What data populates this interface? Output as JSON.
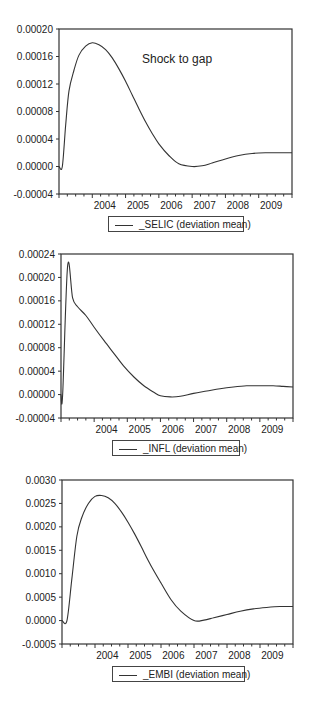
{
  "chart_data": [
    {
      "type": "line",
      "title": "",
      "annotation": "Shock to gap",
      "xlabel": "",
      "ylabel": "",
      "x_tick_labels": [
        "2004",
        "2005",
        "2006",
        "2007",
        "2008",
        "2009"
      ],
      "y_tick_labels": [
        "0.00020",
        "0.00016",
        "0.00012",
        "0.00008",
        "0.00004",
        "0.00000",
        "-0.00004"
      ],
      "ylim": [
        -4e-05,
        0.0002
      ],
      "xlim": [
        2003.0,
        2010.0
      ],
      "grid": false,
      "legend_position": "bottom",
      "series": [
        {
          "name": "_SELIC (deviation mean)",
          "x": [
            2003.0,
            2003.1,
            2003.2,
            2003.3,
            2003.45,
            2003.6,
            2003.8,
            2004.0,
            2004.2,
            2004.4,
            2004.6,
            2004.8,
            2005.0,
            2005.2,
            2005.4,
            2005.6,
            2005.8,
            2006.0,
            2006.3,
            2006.6,
            2007.0,
            2007.3,
            2007.6,
            2008.0,
            2008.4,
            2008.8,
            2009.2,
            2009.6,
            2010.0
          ],
          "values": [
            0.0,
            0.0,
            6e-05,
            0.00011,
            0.00014,
            0.000162,
            0.000175,
            0.00018,
            0.000177,
            0.00017,
            0.000158,
            0.000142,
            0.000124,
            0.000104,
            8.4e-05,
            6.5e-05,
            4.8e-05,
            3.3e-05,
            1.6e-05,
            4e-06,
            0.0,
            1e-06,
            5e-06,
            1.1e-05,
            1.6e-05,
            1.9e-05,
            2e-05,
            2e-05,
            2e-05
          ]
        }
      ]
    },
    {
      "type": "line",
      "title": "",
      "xlabel": "",
      "ylabel": "",
      "x_tick_labels": [
        "2004",
        "2005",
        "2006",
        "2007",
        "2008",
        "2009"
      ],
      "y_tick_labels": [
        "0.00024",
        "0.00020",
        "0.00016",
        "0.00012",
        "0.00008",
        "0.00004",
        "0.00000",
        "-0.00004"
      ],
      "ylim": [
        -4e-05,
        0.00024
      ],
      "xlim": [
        2003.0,
        2010.0
      ],
      "grid": false,
      "legend_position": "bottom",
      "series": [
        {
          "name": "_INFL (deviation mean)",
          "x": [
            2003.0,
            2003.05,
            2003.2,
            2003.35,
            2003.5,
            2003.75,
            2004.0,
            2004.3,
            2004.6,
            2004.9,
            2005.2,
            2005.5,
            2005.8,
            2006.0,
            2006.3,
            2006.6,
            2007.0,
            2007.4,
            2007.8,
            2008.2,
            2008.6,
            2009.0,
            2009.4,
            2009.7,
            2010.0
          ],
          "values": [
            0.0,
            0.0,
            0.00022,
            0.000165,
            0.00015,
            0.000135,
            0.000115,
            9.2e-05,
            7e-05,
            4.8e-05,
            3e-05,
            1.5e-05,
            4e-06,
            -2e-06,
            -4e-06,
            -3e-06,
            2e-06,
            6e-06,
            1e-05,
            1.3e-05,
            1.5e-05,
            1.5e-05,
            1.5e-05,
            1.4e-05,
            1.3e-05
          ]
        }
      ]
    },
    {
      "type": "line",
      "title": "",
      "xlabel": "",
      "ylabel": "",
      "x_tick_labels": [
        "2004",
        "2005",
        "2006",
        "2007",
        "2008",
        "2009"
      ],
      "y_tick_labels": [
        "0.0030",
        "0.0025",
        "0.0020",
        "0.0015",
        "0.0010",
        "0.0005",
        "0.0000",
        "-0.0005"
      ],
      "ylim": [
        -0.0005,
        0.003
      ],
      "xlim": [
        2003.0,
        2010.0
      ],
      "grid": false,
      "legend_position": "bottom",
      "series": [
        {
          "name": "_EMBI (deviation mean)",
          "x": [
            2003.0,
            2003.15,
            2003.3,
            2003.45,
            2003.6,
            2003.8,
            2004.0,
            2004.2,
            2004.4,
            2004.6,
            2004.8,
            2005.0,
            2005.2,
            2005.4,
            2005.6,
            2005.8,
            2006.0,
            2006.3,
            2006.6,
            2007.0,
            2007.3,
            2007.6,
            2008.0,
            2008.4,
            2008.8,
            2009.2,
            2009.6,
            2010.0
          ],
          "values": [
            0.0,
            0.0,
            0.0009,
            0.0018,
            0.0022,
            0.0025,
            0.00265,
            0.00267,
            0.00262,
            0.0025,
            0.00232,
            0.0021,
            0.00185,
            0.00158,
            0.0013,
            0.00104,
            0.0008,
            0.00045,
            0.0002,
            0.0,
            1e-05,
            6e-05,
            0.00013,
            0.0002,
            0.00025,
            0.00028,
            0.0003,
            0.0003
          ]
        }
      ]
    }
  ],
  "charts": [
    {
      "annotation": "Shock to gap",
      "legend": "_SELIC (deviation mean)"
    },
    {
      "legend": "_INFL (deviation mean)"
    },
    {
      "legend": "_EMBI (deviation mean)"
    }
  ],
  "colors": {
    "line": "#333333",
    "axis": "#333333",
    "background": "#ffffff"
  }
}
